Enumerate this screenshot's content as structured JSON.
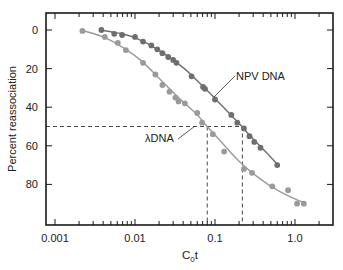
{
  "chart_data": {
    "type": "scatter",
    "title": "",
    "xlabel": "C0t",
    "xlabel_main": "C",
    "xlabel_sub": "0",
    "xlabel_tail": "t",
    "ylabel": "Percent reassociation",
    "xscale": "log",
    "xlim": [
      0.0008,
      2.4
    ],
    "ylim": [
      100,
      -8
    ],
    "y_inverted": true,
    "grid": false,
    "x_ticks": [
      {
        "value": 0.001,
        "label": "0.001"
      },
      {
        "value": 0.01,
        "label": "0.01"
      },
      {
        "value": 0.1,
        "label": "0.1"
      },
      {
        "value": 1.0,
        "label": "1.0"
      }
    ],
    "y_ticks": [
      0,
      20,
      40,
      60,
      80
    ],
    "series": [
      {
        "name": "NPV DNA",
        "label": "NPV DNA",
        "color": "#6e6e6e",
        "points": [
          [
            0.0038,
            0
          ],
          [
            0.0055,
            2
          ],
          [
            0.0069,
            2.6
          ],
          [
            0.01,
            3.6
          ],
          [
            0.0126,
            6
          ],
          [
            0.016,
            8
          ],
          [
            0.019,
            10
          ],
          [
            0.022,
            12
          ],
          [
            0.026,
            14
          ],
          [
            0.03,
            15.5
          ],
          [
            0.033,
            17
          ],
          [
            0.051,
            24
          ],
          [
            0.071,
            29.5
          ],
          [
            0.075,
            30.5
          ],
          [
            0.1,
            36
          ],
          [
            0.16,
            44
          ],
          [
            0.19,
            48
          ],
          [
            0.23,
            51
          ],
          [
            0.27,
            55
          ],
          [
            0.31,
            58
          ],
          [
            0.37,
            61
          ],
          [
            0.6,
            70
          ]
        ],
        "curve": [
          [
            0.0038,
            0.2
          ],
          [
            0.006,
            1.5
          ],
          [
            0.01,
            4
          ],
          [
            0.02,
            10.5
          ],
          [
            0.04,
            19.5
          ],
          [
            0.07,
            29
          ],
          [
            0.1,
            35.5
          ],
          [
            0.2,
            48.5
          ],
          [
            0.3,
            56.5
          ],
          [
            0.45,
            64
          ],
          [
            0.6,
            69.5
          ]
        ]
      },
      {
        "name": "λDNA",
        "label": "λDNA",
        "color": "#9a9a9a",
        "points": [
          [
            0.0022,
            0.5
          ],
          [
            0.0042,
            3.6
          ],
          [
            0.0061,
            6.7
          ],
          [
            0.0077,
            10.4
          ],
          [
            0.0126,
            17
          ],
          [
            0.018,
            23
          ],
          [
            0.022,
            28.5
          ],
          [
            0.027,
            32
          ],
          [
            0.032,
            35
          ],
          [
            0.035,
            37
          ],
          [
            0.042,
            38
          ],
          [
            0.06,
            43
          ],
          [
            0.069,
            48
          ],
          [
            0.094,
            54
          ],
          [
            0.13,
            63
          ],
          [
            0.23,
            72
          ],
          [
            0.29,
            74
          ],
          [
            0.52,
            81
          ],
          [
            0.82,
            83
          ],
          [
            1.06,
            90
          ],
          [
            1.29,
            90
          ]
        ],
        "curve": [
          [
            0.0022,
            0.3
          ],
          [
            0.004,
            3.5
          ],
          [
            0.007,
            9
          ],
          [
            0.012,
            16
          ],
          [
            0.02,
            25
          ],
          [
            0.035,
            35
          ],
          [
            0.06,
            44
          ],
          [
            0.08,
            50
          ],
          [
            0.12,
            58
          ],
          [
            0.2,
            68
          ],
          [
            0.35,
            76.5
          ],
          [
            0.6,
            83
          ],
          [
            1.0,
            87.5
          ],
          [
            1.3,
            89.5
          ]
        ]
      }
    ],
    "annotations": [
      {
        "type": "hline_dashed",
        "y": 50,
        "x_end": 0.22
      },
      {
        "type": "vline_dashed",
        "x": 0.08,
        "y_start": 50
      },
      {
        "type": "vline_dashed",
        "x": 0.22,
        "y_start": 50
      },
      {
        "type": "label",
        "text": "NPV DNA",
        "x_px": 236,
        "y_px": 80,
        "leader_to": [
          214,
          97
        ]
      },
      {
        "type": "label",
        "text": "λDNA",
        "x_px": 145,
        "y_px": 142,
        "leader_to": [
          195,
          126
        ]
      }
    ]
  }
}
